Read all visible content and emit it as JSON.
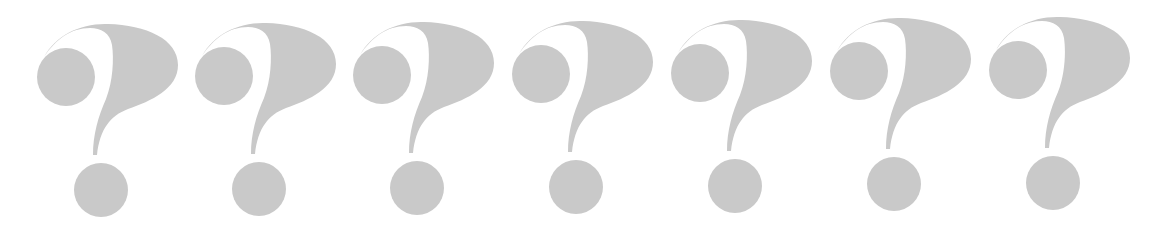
{
  "image": {
    "description": "Row of seven large light-grey question marks on white background",
    "glyph": "?",
    "count": 7,
    "fill_color": "#c9c9c9",
    "background_color": "#ffffff"
  },
  "glyphs": [
    {
      "cx": 66,
      "cy": 77,
      "label": "?"
    },
    {
      "cx": 224,
      "cy": 76,
      "label": "?"
    },
    {
      "cx": 382,
      "cy": 75,
      "label": "?"
    },
    {
      "cx": 541,
      "cy": 74,
      "label": "?"
    },
    {
      "cx": 700,
      "cy": 73,
      "label": "?"
    },
    {
      "cx": 859,
      "cy": 71,
      "label": "?"
    },
    {
      "cx": 1018,
      "cy": 70,
      "label": "?"
    }
  ]
}
